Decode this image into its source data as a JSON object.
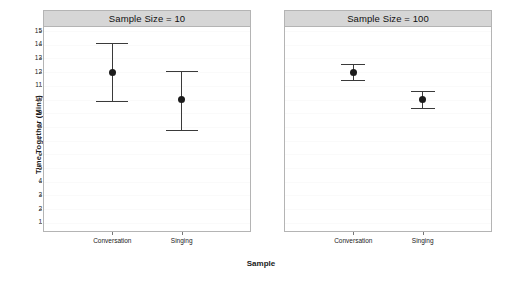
{
  "chart_data": {
    "type": "scatter",
    "title": "",
    "xlabel": "Sample",
    "ylabel": "Time Together (Mins)",
    "ylim": [
      0.4,
      15.3
    ],
    "yticks": [
      1,
      2,
      3,
      4,
      5,
      6,
      7,
      8,
      9,
      10,
      11,
      12,
      13,
      14,
      15
    ],
    "ytick_labels": [
      "1",
      "2",
      "3",
      "4",
      "5",
      "6",
      "7",
      "8",
      "9",
      "10",
      "11",
      "12",
      "13",
      "14",
      "15"
    ],
    "grid": true,
    "legend": "none",
    "categories": [
      "Conversation",
      "Singing"
    ],
    "panel_variable": "Sample Size",
    "panels": [
      {
        "strip_label": "Sample Size = 10",
        "sample_size": 10,
        "points": [
          {
            "category": "Conversation",
            "mean": 12.0,
            "lower": 9.9,
            "upper": 14.1
          },
          {
            "category": "Singing",
            "mean": 10.0,
            "lower": 7.8,
            "upper": 12.1
          }
        ]
      },
      {
        "strip_label": "Sample Size = 100",
        "sample_size": 100,
        "points": [
          {
            "category": "Conversation",
            "mean": 12.0,
            "lower": 11.4,
            "upper": 12.6
          },
          {
            "category": "Singing",
            "mean": 10.0,
            "lower": 9.4,
            "upper": 10.6
          }
        ]
      }
    ],
    "colors": {
      "point": "#1c1c1c",
      "errorbar": "#3a3a3a",
      "strip_background": "#d6d6d6",
      "panel_border": "#b4b4b4",
      "plot_background": "#ffffff",
      "axis_text": "#222222"
    }
  }
}
